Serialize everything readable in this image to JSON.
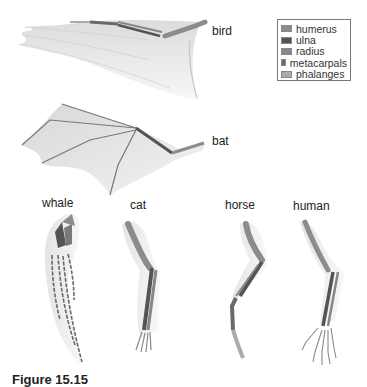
{
  "figure": {
    "caption_visible": "Figure 15.15",
    "colors": {
      "humerus": "#8c8c8c",
      "ulna": "#545454",
      "radius": "#878787",
      "metacarpals": "#696969",
      "phalanges": "#ababab",
      "membrane": "#e6e6e6",
      "feather": "#efefef"
    }
  },
  "legend": {
    "items": [
      {
        "label": "humerus",
        "color": "#8c8c8c"
      },
      {
        "label": "ulna",
        "color": "#545454"
      },
      {
        "label": "radius",
        "color": "#878787"
      },
      {
        "label": "metacarpals",
        "color": "#696969"
      },
      {
        "label": "phalanges",
        "color": "#ababab"
      }
    ]
  },
  "specimens": [
    {
      "id": "bird",
      "label": "bird"
    },
    {
      "id": "bat",
      "label": "bat"
    },
    {
      "id": "whale",
      "label": "whale"
    },
    {
      "id": "cat",
      "label": "cat"
    },
    {
      "id": "horse",
      "label": "horse"
    },
    {
      "id": "human",
      "label": "human"
    }
  ]
}
